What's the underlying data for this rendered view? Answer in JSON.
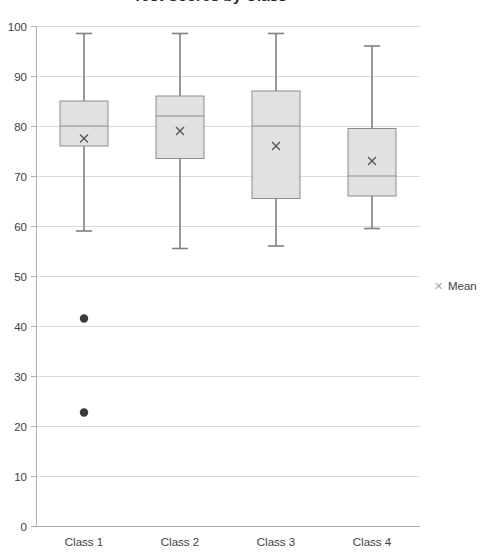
{
  "chart_data": {
    "type": "box",
    "title": "Test Scores by Class",
    "xlabel": "",
    "ylabel": "",
    "ylim": [
      0,
      100
    ],
    "ytick_step": 10,
    "yticks": [
      0,
      10,
      20,
      30,
      40,
      50,
      60,
      70,
      80,
      90,
      100
    ],
    "ytick_labels": [
      "0",
      "10",
      "20",
      "30",
      "40",
      "50",
      "60",
      "70",
      "80",
      "90",
      "100"
    ],
    "categories": [
      "Class 1",
      "Class 2",
      "Class 3",
      "Class 4"
    ],
    "grid": true,
    "legend": {
      "position": "right",
      "entries": [
        {
          "label": "Mean",
          "marker": "x",
          "color": "#a6a6a6"
        }
      ]
    },
    "boxes": [
      {
        "category": "Class 1",
        "whisker_low": 59.0,
        "q1": 76.0,
        "median": 80.0,
        "q3": 85.0,
        "whisker_high": 98.5,
        "mean": 77.5,
        "outliers": [
          41.5,
          22.7
        ]
      },
      {
        "category": "Class 2",
        "whisker_low": 55.5,
        "q1": 73.5,
        "median": 82.0,
        "q3": 86.0,
        "whisker_high": 98.5,
        "mean": 79.0,
        "outliers": []
      },
      {
        "category": "Class 3",
        "whisker_low": 56.0,
        "q1": 65.5,
        "median": 80.0,
        "q3": 87.0,
        "whisker_high": 98.5,
        "mean": 76.0,
        "outliers": []
      },
      {
        "category": "Class 4",
        "whisker_low": 59.5,
        "q1": 66.0,
        "median": 70.0,
        "q3": 79.5,
        "whisker_high": 96.0,
        "mean": 73.0,
        "outliers": []
      }
    ],
    "colors": {
      "box_fill": "#dedede",
      "box_stroke": "#8c8c8c",
      "whisker": "#808080",
      "mean_marker": "#595959",
      "outlier": "#3a3a3a",
      "gridline": "#d9d9d9",
      "axis": "#b0b0b0",
      "text": "#404040"
    }
  }
}
